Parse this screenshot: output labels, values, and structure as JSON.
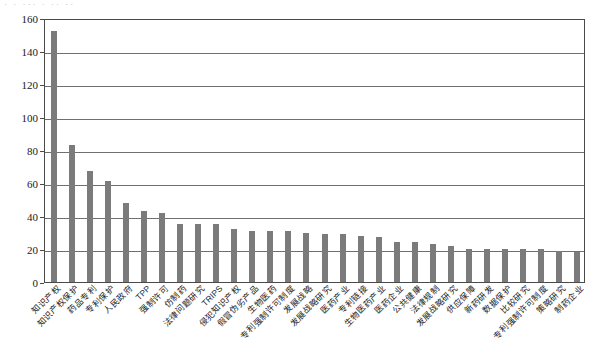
{
  "top_sliver_text": "· · ··· · ·· ··",
  "chart_data": {
    "type": "bar",
    "title": "",
    "xlabel": "",
    "ylabel": "",
    "ylim": [
      0,
      160
    ],
    "ytick_step": 20,
    "yticks": [
      0,
      20,
      40,
      60,
      80,
      100,
      120,
      140,
      160
    ],
    "grid": true,
    "legend": "none",
    "bar_color": "#7b7b7b",
    "axis_color": "#4a4a4a",
    "grid_color": "#6f6f6f",
    "categories": [
      "知识产权",
      "知识产权保护",
      "药品专利",
      "专利保护",
      "人民政府",
      "TPP",
      "强制许可",
      "仿制药",
      "法律问题研究",
      "TRIPS",
      "侵犯知识产权",
      "假冒伪劣产品",
      "生物医药",
      "专利强制许可制度",
      "发展战略",
      "发展战略研究",
      "医药产业",
      "专利链接",
      "生物医药产业",
      "医药企业",
      "公共健康",
      "法律规制",
      "发展战略研究",
      "供应保障",
      "新药研发",
      "数据保护",
      "比较研究",
      "专利强制许可制度",
      "策略研究",
      "制药企业"
    ],
    "values": [
      152,
      83,
      67,
      61,
      48,
      43,
      42,
      35,
      35,
      35,
      32,
      31,
      31,
      31,
      30,
      29,
      29,
      28,
      27,
      24,
      24,
      23,
      22,
      20,
      20,
      20,
      20,
      20,
      19,
      18
    ]
  }
}
